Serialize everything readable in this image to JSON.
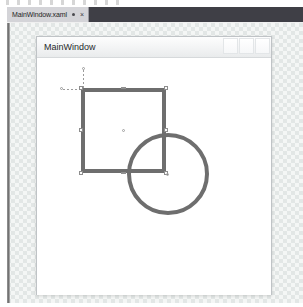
{
  "app": {
    "theme": "visual-studio-dark-tabs",
    "accent_color": "#3f3f46",
    "shape_stroke_color": "#6e6e6e",
    "designer_background_color": "#f4f6f5"
  },
  "editor": {
    "tab": {
      "label": "MainWindow.xaml",
      "dirty_indicator": "●",
      "close_label": "×"
    }
  },
  "design_window": {
    "title": "MainWindow",
    "buttons": [
      {
        "name": "minimize",
        "label": ""
      },
      {
        "name": "maximize",
        "label": ""
      },
      {
        "name": "close",
        "label": ""
      }
    ]
  },
  "canvas": {
    "shapes": [
      {
        "name": "rectangle",
        "selected": true,
        "stroke": "#6e6e6e",
        "stroke_thickness": 4,
        "x": 44,
        "y": 30,
        "width": 85,
        "height": 85
      },
      {
        "name": "ellipse",
        "selected": false,
        "stroke": "#6e6e6e",
        "stroke_thickness": 4,
        "x": 90,
        "y": 75,
        "width": 82,
        "height": 82
      }
    ]
  }
}
